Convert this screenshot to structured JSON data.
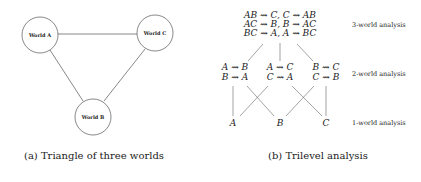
{
  "figure_a": {
    "caption": "(a) Triangle of three worlds",
    "nodes": [
      {
        "id": "A",
        "label": "World A",
        "cx": 40,
        "cy": 35,
        "r": 18
      },
      {
        "id": "C",
        "label": "World C",
        "cx": 155,
        "cy": 33,
        "r": 18
      },
      {
        "id": "B",
        "label": "World B",
        "cx": 93,
        "cy": 117,
        "r": 18
      }
    ],
    "edges": [
      [
        "A",
        "C"
      ],
      [
        "A",
        "B"
      ],
      [
        "C",
        "B"
      ]
    ]
  },
  "figure_b": {
    "caption": "(b) Trilevel analysis",
    "level3": {
      "lines": [
        "AB ⇝ C, C ⇝ AB",
        "AC ⇝ B, B ⇝ AC",
        "BC ⇝ A, A ⇝ BC"
      ],
      "label": "3-world analysis"
    },
    "level2": {
      "groups": [
        {
          "line1": "A ⇝ B",
          "line2": "B ⇝ A"
        },
        {
          "line1": "A ⇝ C",
          "line2": "C ⇝ A"
        },
        {
          "line1": "B ⇝ C",
          "line2": "C ⇝ B"
        }
      ],
      "label": "2-world analysis"
    },
    "level1": {
      "items": [
        "A",
        "B",
        "C"
      ],
      "label": "1-world analysis"
    }
  }
}
